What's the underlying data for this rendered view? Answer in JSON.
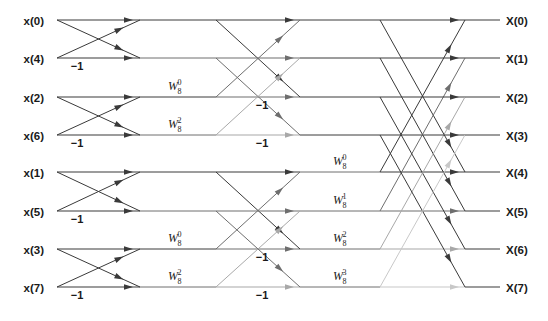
{
  "diagram": {
    "canvas": {
      "width": 548,
      "height": 321,
      "background": "#ffffff"
    },
    "geometry": {
      "row_y": [
        20,
        58,
        97,
        135,
        172,
        211,
        249,
        287
      ],
      "x_label_right": 52,
      "x_stage1_start": 57,
      "x_stage1_end": 140,
      "x_stage2_start": 216,
      "x_stage2_end": 300,
      "x_stage3_start": 380,
      "x_stage3_end": 465,
      "x_out_line_end": 500,
      "x_out_label": 506
    },
    "colors": {
      "line_dark": "#3a3a3a",
      "line_mid": "#6e6e6e",
      "line_light": "#a8a8a8",
      "line_pale": "#c8c8c8",
      "text": "#1a1a1a",
      "background": "#ffffff"
    }
  },
  "inputs": [
    {
      "label": "x(0)",
      "row": 0
    },
    {
      "label": "x(4)",
      "row": 1
    },
    {
      "label": "x(2)",
      "row": 2
    },
    {
      "label": "x(6)",
      "row": 3
    },
    {
      "label": "x(1)",
      "row": 4
    },
    {
      "label": "x(5)",
      "row": 5
    },
    {
      "label": "x(3)",
      "row": 6
    },
    {
      "label": "x(7)",
      "row": 7
    }
  ],
  "outputs": [
    {
      "label": "X(0)",
      "row": 0
    },
    {
      "label": "X(1)",
      "row": 1
    },
    {
      "label": "X(2)",
      "row": 2
    },
    {
      "label": "X(3)",
      "row": 3
    },
    {
      "label": "X(4)",
      "row": 4
    },
    {
      "label": "X(5)",
      "row": 5
    },
    {
      "label": "X(6)",
      "row": 6
    },
    {
      "label": "X(7)",
      "row": 7
    }
  ],
  "stage1": {
    "name": "stage-1-butterflies",
    "pairs": [
      [
        0,
        1
      ],
      [
        2,
        3
      ],
      [
        4,
        5
      ],
      [
        6,
        7
      ]
    ],
    "minus_one_labels": [
      {
        "text": "−1",
        "x": 77,
        "y": 70
      },
      {
        "text": "−1",
        "x": 77,
        "y": 147
      },
      {
        "text": "−1",
        "x": 77,
        "y": 223
      },
      {
        "text": "−1",
        "x": 77,
        "y": 299
      }
    ]
  },
  "stage2": {
    "name": "stage-2-butterflies",
    "pairs": [
      [
        0,
        2
      ],
      [
        1,
        3
      ],
      [
        4,
        6
      ],
      [
        5,
        7
      ]
    ],
    "twiddles": [
      {
        "base": "W",
        "sub": "8",
        "sup": "0",
        "x": 168,
        "y": 90,
        "row": 2
      },
      {
        "base": "W",
        "sub": "8",
        "sup": "2",
        "x": 168,
        "y": 128,
        "row": 3
      },
      {
        "base": "W",
        "sub": "8",
        "sup": "0",
        "x": 168,
        "y": 242,
        "row": 6
      },
      {
        "base": "W",
        "sub": "8",
        "sup": "2",
        "x": 168,
        "y": 280,
        "row": 7
      }
    ],
    "minus_one_labels": [
      {
        "text": "−1",
        "x": 262,
        "y": 109
      },
      {
        "text": "−1",
        "x": 262,
        "y": 147
      },
      {
        "text": "−1",
        "x": 262,
        "y": 261
      },
      {
        "text": "−1",
        "x": 262,
        "y": 299
      }
    ]
  },
  "stage3": {
    "name": "stage-3-butterflies",
    "pairs": [
      [
        0,
        4
      ],
      [
        1,
        5
      ],
      [
        2,
        6
      ],
      [
        3,
        7
      ]
    ],
    "twiddles": [
      {
        "base": "W",
        "sub": "8",
        "sup": "0",
        "x": 333,
        "y": 165,
        "row": 4
      },
      {
        "base": "W",
        "sub": "8",
        "sup": "1",
        "x": 333,
        "y": 204,
        "row": 5
      },
      {
        "base": "W",
        "sub": "8",
        "sup": "2",
        "x": 333,
        "y": 242,
        "row": 6
      },
      {
        "base": "W",
        "sub": "8",
        "sup": "3",
        "x": 333,
        "y": 280,
        "row": 7
      }
    ]
  }
}
